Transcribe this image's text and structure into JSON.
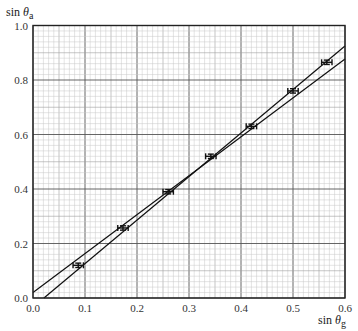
{
  "chart_data": {
    "type": "scatter",
    "title": "",
    "xlabel": "sin θg",
    "ylabel": "sin θa",
    "xlabel_parts": {
      "base": "sin ",
      "theta": "θ",
      "sub": "g"
    },
    "ylabel_parts": {
      "base": "sin ",
      "theta": "θ",
      "sub": "a"
    },
    "xlim": [
      0.0,
      0.6
    ],
    "ylim": [
      0.0,
      1.0
    ],
    "x_ticks": [
      "0.0",
      "0.1",
      "0.2",
      "0.3",
      "0.4",
      "0.5",
      "0.6"
    ],
    "y_ticks": [
      "0.0",
      "0.2",
      "0.4",
      "0.6",
      "0.8",
      "1.0"
    ],
    "grid": {
      "on": true,
      "major_x": 0.1,
      "major_y": 0.2,
      "medium_x": 0.05,
      "medium_y": 0.1,
      "minor_x": 0.01,
      "minor_y": 0.02
    },
    "series": [
      {
        "name": "measurements",
        "kind": "points_with_error_bars",
        "x": [
          0.087,
          0.173,
          0.26,
          0.342,
          0.42,
          0.5,
          0.565
        ],
        "y": [
          0.12,
          0.257,
          0.39,
          0.52,
          0.63,
          0.76,
          0.865
        ],
        "x_err": 0.01,
        "y_err": 0.008
      },
      {
        "name": "line-max-gradient",
        "kind": "line",
        "x": [
          0.021,
          0.6
        ],
        "y": [
          0.0,
          0.925
        ]
      },
      {
        "name": "line-min-gradient",
        "kind": "line",
        "x": [
          0.0,
          0.6
        ],
        "y": [
          0.02,
          0.877
        ]
      }
    ],
    "legend": null
  },
  "colors": {
    "background": "#ffffff",
    "grid_minor": "#c8c8c8",
    "grid_medium": "#a0a0a0",
    "grid_major": "#555555",
    "axis": "#222222",
    "data": "#111111"
  }
}
